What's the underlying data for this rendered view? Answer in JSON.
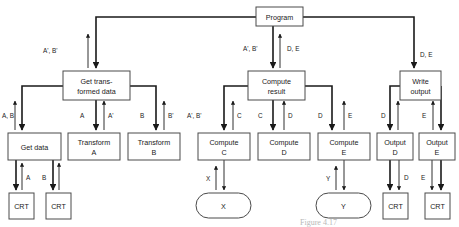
{
  "diagram": {
    "type": "structure-chart",
    "colors": {
      "background": "#ffffff",
      "box_stroke": "#4a4a4a",
      "line": "#1a1a1a",
      "text": "#1a1a1a",
      "caption": "#b8b8b8"
    },
    "nodes": [
      {
        "id": "program",
        "label": "Program",
        "shape": "box",
        "x": 256,
        "y": 7,
        "w": 47,
        "h": 19
      },
      {
        "id": "gettrans",
        "label": "Get trans-\nformed data",
        "shape": "box",
        "x": 63,
        "y": 71,
        "w": 67,
        "h": 29
      },
      {
        "id": "computeres",
        "label": "Compute\nresult",
        "shape": "box",
        "x": 248,
        "y": 71,
        "w": 57,
        "h": 29
      },
      {
        "id": "writeout",
        "label": "Write\noutput",
        "shape": "box",
        "x": 400,
        "y": 71,
        "w": 41,
        "h": 29
      },
      {
        "id": "getdata",
        "label": "Get data",
        "shape": "box",
        "x": 8,
        "y": 133,
        "w": 53,
        "h": 27
      },
      {
        "id": "transa",
        "label": "Transform\nA",
        "shape": "box",
        "x": 68,
        "y": 133,
        "w": 52,
        "h": 27
      },
      {
        "id": "transb",
        "label": "Transform\nB",
        "shape": "box",
        "x": 128,
        "y": 133,
        "w": 52,
        "h": 27
      },
      {
        "id": "computec",
        "label": "Compute\nC",
        "shape": "box",
        "x": 198,
        "y": 133,
        "w": 52,
        "h": 27
      },
      {
        "id": "computed",
        "label": "Compute\nD",
        "shape": "box",
        "x": 258,
        "y": 133,
        "w": 52,
        "h": 27
      },
      {
        "id": "computee",
        "label": "Compute\nE",
        "shape": "box",
        "x": 318,
        "y": 133,
        "w": 52,
        "h": 27
      },
      {
        "id": "outputd",
        "label": "Output\nD",
        "shape": "box",
        "x": 377,
        "y": 133,
        "w": 36,
        "h": 27
      },
      {
        "id": "outpute",
        "label": "Output\nE",
        "shape": "box",
        "x": 419,
        "y": 133,
        "w": 36,
        "h": 27
      },
      {
        "id": "crt1",
        "label": "CRT",
        "shape": "box",
        "x": 9,
        "y": 193,
        "w": 25,
        "h": 26
      },
      {
        "id": "crt2",
        "label": "CRT",
        "shape": "box",
        "x": 46,
        "y": 193,
        "w": 25,
        "h": 26
      },
      {
        "id": "crt3",
        "label": "CRT",
        "shape": "box",
        "x": 383,
        "y": 193,
        "w": 25,
        "h": 26
      },
      {
        "id": "crt4",
        "label": "CRT",
        "shape": "box",
        "x": 425,
        "y": 193,
        "w": 25,
        "h": 26
      },
      {
        "id": "ovalx",
        "label": "X",
        "shape": "oval",
        "x": 196,
        "y": 193,
        "w": 55,
        "h": 25
      },
      {
        "id": "ovaly",
        "label": "Y",
        "shape": "oval",
        "x": 316,
        "y": 193,
        "w": 55,
        "h": 25
      }
    ],
    "edge_labels": [
      {
        "id": "lbl-left-up",
        "text": "A', B'",
        "x": 62,
        "y": 51
      },
      {
        "id": "lbl-mid-down",
        "text": "A', B'",
        "x": 224,
        "y": 49
      },
      {
        "id": "lbl-mid-up",
        "text": "D, E",
        "x": 267,
        "y": 49
      },
      {
        "id": "lbl-right-down",
        "text": "D, E",
        "x": 419,
        "y": 55
      },
      {
        "id": "lbl-getdata",
        "text": "A, B",
        "x": 3,
        "y": 116
      },
      {
        "id": "lbl-transa-in",
        "text": "A",
        "x": 78,
        "y": 116
      },
      {
        "id": "lbl-transa-out",
        "text": "A'",
        "x": 101,
        "y": 116
      },
      {
        "id": "lbl-transb-in",
        "text": "B",
        "x": 138,
        "y": 116
      },
      {
        "id": "lbl-transb-out",
        "text": "B'",
        "x": 161,
        "y": 116
      },
      {
        "id": "lbl-computec-in",
        "text": "A', B'",
        "x": 187,
        "y": 116
      },
      {
        "id": "lbl-computec-out",
        "text": "C",
        "x": 231,
        "y": 116
      },
      {
        "id": "lbl-computed-in",
        "text": "C",
        "x": 256,
        "y": 116
      },
      {
        "id": "lbl-computed-out",
        "text": "D",
        "x": 291,
        "y": 116
      },
      {
        "id": "lbl-computee-in",
        "text": "D",
        "x": 316,
        "y": 116
      },
      {
        "id": "lbl-computee-out",
        "text": "E",
        "x": 351,
        "y": 116
      },
      {
        "id": "lbl-outputd",
        "text": "D",
        "x": 385,
        "y": 116
      },
      {
        "id": "lbl-outpute",
        "text": "E",
        "x": 426,
        "y": 116
      },
      {
        "id": "lbl-crt1",
        "text": "A",
        "x": 25,
        "y": 177
      },
      {
        "id": "lbl-crt2",
        "text": "B",
        "x": 41,
        "y": 177
      },
      {
        "id": "lbl-x",
        "text": "X",
        "x": 205,
        "y": 178
      },
      {
        "id": "lbl-y",
        "text": "Y",
        "x": 325,
        "y": 178
      },
      {
        "id": "lbl-crt3",
        "text": "D",
        "x": 404,
        "y": 177
      },
      {
        "id": "lbl-crt4",
        "text": "E",
        "x": 415,
        "y": 177
      }
    ],
    "caption": "Figure 4.17"
  }
}
